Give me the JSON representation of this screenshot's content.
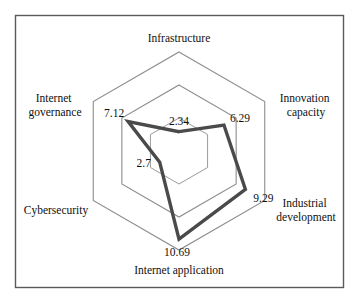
{
  "chart_data": {
    "type": "radar",
    "title": "",
    "subtitle": "",
    "xlabel": "",
    "ylabel": "",
    "grid": true,
    "legend": "none",
    "rings": 3,
    "rmax": 12,
    "rmin": 0,
    "categories": [
      "Infrastructure",
      "Innovation capacity",
      "Industrial development",
      "Internet application",
      "Cybersecurity",
      "Internet governance"
    ],
    "values": [
      2.34,
      6.29,
      9.29,
      10.69,
      2.7,
      7.12
    ],
    "value_labels": [
      "2.34",
      "6.29",
      "9.29",
      "10.69",
      "2.7",
      "7.12"
    ],
    "series": [
      {
        "name": "",
        "values": [
          2.34,
          6.29,
          9.29,
          10.69,
          2.7,
          7.12
        ]
      }
    ]
  },
  "axes": [
    {
      "id": "infrastructure",
      "label": "Infrastructure",
      "label_line1": "Infrastructure",
      "label_line2": "",
      "value": 2.34,
      "value_text": "2.34"
    },
    {
      "id": "innovation-capacity",
      "label": "Innovation capacity",
      "label_line1": "Innovation",
      "label_line2": "capacity",
      "value": 6.29,
      "value_text": "6.29"
    },
    {
      "id": "industrial-development",
      "label": "Industrial development",
      "label_line1": "Industrial",
      "label_line2": "development",
      "value": 9.29,
      "value_text": "9.29"
    },
    {
      "id": "internet-application",
      "label": "Internet application",
      "label_line1": "Internet application",
      "label_line2": "",
      "value": 10.69,
      "value_text": "10.69"
    },
    {
      "id": "cybersecurity",
      "label": "Cybersecurity",
      "label_line1": "Cybersecurity",
      "label_line2": "",
      "value": 2.7,
      "value_text": "2.7"
    },
    {
      "id": "internet-governance",
      "label": "Internet governance",
      "label_line1": "Internet",
      "label_line2": "governance",
      "value": 7.12,
      "value_text": "7.12"
    }
  ],
  "colors": {
    "frame_border": "#5a5a5a",
    "grid_line": "#8d8d8d",
    "data_line": "#4a4a4a",
    "background": "#ffffff",
    "text": "#101010"
  }
}
